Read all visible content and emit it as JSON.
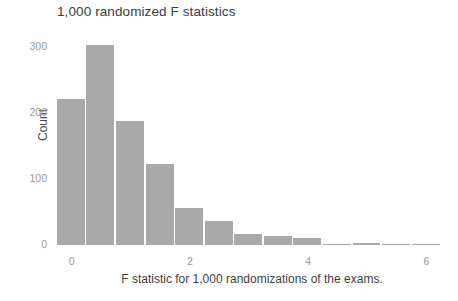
{
  "chart_data": {
    "type": "bar",
    "title": "1,000 randomized F statistics",
    "xlabel": "F statistic for 1,000 randomizations of the exams.",
    "ylabel": "Count",
    "grid": false,
    "legend": null,
    "legend_position": "none",
    "bin_width": 0.5,
    "xlim": [
      -0.35,
      6.45
    ],
    "ylim": [
      0,
      320
    ],
    "x_ticks": [
      {
        "value": 0,
        "label": "0"
      },
      {
        "value": 2,
        "label": "2"
      },
      {
        "value": 4,
        "label": "4"
      },
      {
        "value": 6,
        "label": "6"
      }
    ],
    "y_ticks": [
      {
        "value": 0,
        "label": "0"
      },
      {
        "value": 100,
        "label": "100"
      },
      {
        "value": 200,
        "label": "200"
      },
      {
        "value": 300,
        "label": "300"
      }
    ],
    "bar_color": "#a9a9a9",
    "panel_background": "#ffffff",
    "bins": [
      {
        "x_left": -0.25,
        "x_center": 0.0,
        "value": 222
      },
      {
        "x_left": 0.25,
        "x_center": 0.5,
        "value": 303
      },
      {
        "x_left": 0.75,
        "x_center": 1.0,
        "value": 188
      },
      {
        "x_left": 1.25,
        "x_center": 1.5,
        "value": 123
      },
      {
        "x_left": 1.75,
        "x_center": 2.0,
        "value": 56
      },
      {
        "x_left": 2.25,
        "x_center": 2.5,
        "value": 37
      },
      {
        "x_left": 2.75,
        "x_center": 3.0,
        "value": 16
      },
      {
        "x_left": 3.25,
        "x_center": 3.5,
        "value": 14
      },
      {
        "x_left": 3.75,
        "x_center": 4.0,
        "value": 11
      },
      {
        "x_left": 4.25,
        "x_center": 4.5,
        "value": 2
      },
      {
        "x_left": 4.75,
        "x_center": 5.0,
        "value": 3
      },
      {
        "x_left": 5.25,
        "x_center": 5.5,
        "value": 1
      },
      {
        "x_left": 5.75,
        "x_center": 6.0,
        "value": 1
      }
    ],
    "categories": [
      "0.0",
      "0.5",
      "1.0",
      "1.5",
      "2.0",
      "2.5",
      "3.0",
      "3.5",
      "4.0",
      "4.5",
      "5.0",
      "5.5",
      "6.0"
    ],
    "values": [
      222,
      303,
      188,
      123,
      56,
      37,
      16,
      14,
      11,
      2,
      3,
      1,
      1
    ]
  }
}
